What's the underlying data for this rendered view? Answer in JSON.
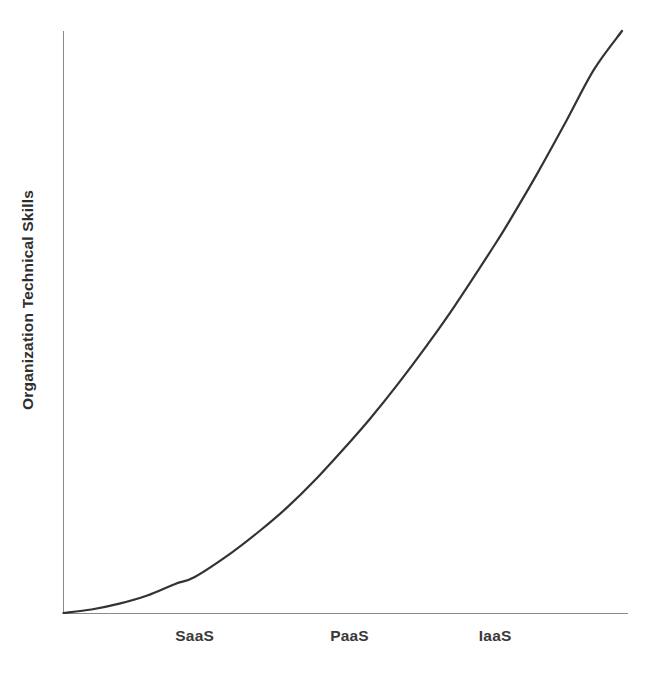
{
  "chart_data": {
    "type": "line",
    "title": "",
    "subtitle": "",
    "xlabel": "",
    "ylabel": "Organization Technical Skills",
    "categories": [
      "SaaS",
      "PaaS",
      "IaaS"
    ],
    "category_x_positions": [
      0.235,
      0.512,
      0.773
    ],
    "grid": false,
    "legend": null,
    "legend_position": "none",
    "axis_numeric_ticks": false,
    "xlim": [
      0,
      1
    ],
    "ylim": [
      0,
      1
    ],
    "annotations": [],
    "series": [
      {
        "name": "Organization Technical Skills vs Cloud Service Model",
        "color": "#333333",
        "x": [
          0.0,
          0.05,
          0.1,
          0.15,
          0.2,
          0.235,
          0.3,
          0.35,
          0.4,
          0.45,
          0.512,
          0.55,
          0.6,
          0.65,
          0.7,
          0.773,
          0.8,
          0.85,
          0.9,
          0.95,
          1.0
        ],
        "y": [
          0.0,
          0.006,
          0.016,
          0.03,
          0.05,
          0.062,
          0.103,
          0.14,
          0.181,
          0.228,
          0.293,
          0.335,
          0.395,
          0.459,
          0.527,
          0.634,
          0.676,
          0.758,
          0.845,
          0.934,
          1.0
        ]
      }
    ],
    "tick_labels_x": [
      "SaaS",
      "PaaS",
      "IaaS"
    ],
    "tick_labels_y": [],
    "colors": {
      "background": "#ffffff",
      "axis": "#8a8a8a",
      "curve": "#333333",
      "text": "#3a3a3a"
    }
  },
  "axes": {
    "y_axis_title": "Organization Technical Skills",
    "x_tick_1": "SaaS",
    "x_tick_2": "PaaS",
    "x_tick_3": "IaaS"
  }
}
